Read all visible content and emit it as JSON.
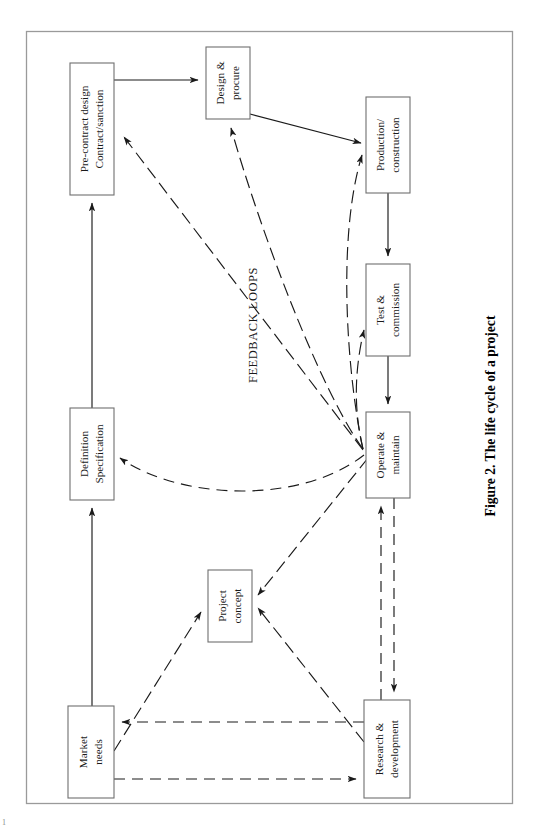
{
  "figure": {
    "caption": "Figure 2.  The life cycle of a project",
    "feedback_label": "FEEDBACK LOOPS",
    "orientation": "rotated-90-clockwise",
    "frame": {
      "x": 26,
      "y": 31,
      "width": 486,
      "height": 772,
      "stroke": "#9a9a9a"
    }
  },
  "colors": {
    "box_stroke": "#6f6f6f",
    "line": "#1a1a1a",
    "frame": "#9a9a9a",
    "background": "#ffffff"
  },
  "nodes": [
    {
      "id": "pre-contract",
      "lines": [
        "Pre-contract design",
        "Contract/sanction"
      ],
      "x": 70,
      "y": 63,
      "w": 44,
      "h": 132
    },
    {
      "id": "design-procure",
      "lines": [
        "Design &",
        "procure"
      ],
      "x": 206,
      "y": 47,
      "w": 44,
      "h": 72
    },
    {
      "id": "production-construction",
      "lines": [
        "Production/",
        "construction"
      ],
      "x": 366,
      "y": 97,
      "w": 44,
      "h": 96
    },
    {
      "id": "test-commission",
      "lines": [
        "Test &",
        "commission"
      ],
      "x": 366,
      "y": 264,
      "w": 44,
      "h": 92
    },
    {
      "id": "operate-maintain",
      "lines": [
        "Operate &",
        "maintain"
      ],
      "x": 366,
      "y": 412,
      "w": 44,
      "h": 86
    },
    {
      "id": "definition-specification",
      "lines": [
        "Definition",
        "Specification"
      ],
      "x": 70,
      "y": 408,
      "w": 44,
      "h": 92
    },
    {
      "id": "project-concept",
      "lines": [
        "Project",
        "concept"
      ],
      "x": 208,
      "y": 570,
      "w": 44,
      "h": 72
    },
    {
      "id": "market-needs",
      "lines": [
        "Market",
        "needs"
      ],
      "x": 68,
      "y": 706,
      "w": 46,
      "h": 92
    },
    {
      "id": "research-development",
      "lines": [
        "Research &",
        "development"
      ],
      "x": 364,
      "y": 700,
      "w": 46,
      "h": 98
    }
  ],
  "edges": [
    {
      "id": "market-to-definition",
      "from": "market-needs",
      "to": "definition-specification",
      "style": "solid"
    },
    {
      "id": "definition-to-precontract",
      "from": "definition-specification",
      "to": "pre-contract",
      "style": "solid"
    },
    {
      "id": "precontract-to-design",
      "from": "pre-contract",
      "to": "design-procure",
      "style": "solid"
    },
    {
      "id": "design-to-production",
      "from": "design-procure",
      "to": "production-construction",
      "style": "solid"
    },
    {
      "id": "production-to-test",
      "from": "production-construction",
      "to": "test-commission",
      "style": "solid"
    },
    {
      "id": "test-to-operate",
      "from": "test-commission",
      "to": "operate-maintain",
      "style": "solid"
    },
    {
      "id": "market-to-concept",
      "from": "market-needs",
      "to": "project-concept",
      "style": "dashdot"
    },
    {
      "id": "rnd-to-concept",
      "from": "research-development",
      "to": "project-concept",
      "style": "dashdot"
    },
    {
      "id": "operate-to-concept",
      "from": "operate-maintain",
      "to": "project-concept",
      "style": "dashdot"
    },
    {
      "id": "rnd-to-market",
      "from": "research-development",
      "to": "market-needs",
      "style": "dashed"
    },
    {
      "id": "market-to-rnd",
      "from": "market-needs",
      "to": "research-development",
      "style": "dashed"
    },
    {
      "id": "rnd-to-operate",
      "from": "research-development",
      "to": "operate-maintain",
      "style": "dashed"
    },
    {
      "id": "operate-to-rnd",
      "from": "operate-maintain",
      "to": "research-development",
      "style": "dashed"
    },
    {
      "id": "operate-to-definition",
      "from": "operate-maintain",
      "to": "definition-specification",
      "style": "dashed",
      "kind": "feedback"
    },
    {
      "id": "operate-to-precontract",
      "from": "operate-maintain",
      "to": "pre-contract",
      "style": "dashdot",
      "kind": "feedback"
    },
    {
      "id": "operate-to-design",
      "from": "operate-maintain",
      "to": "design-procure",
      "style": "dashdot",
      "kind": "feedback"
    },
    {
      "id": "operate-to-production",
      "from": "operate-maintain",
      "to": "production-construction",
      "style": "dashdot",
      "kind": "feedback"
    },
    {
      "id": "operate-to-test",
      "from": "operate-maintain",
      "to": "test-commission",
      "style": "dashdot",
      "kind": "feedback"
    }
  ],
  "page_mark": "1"
}
